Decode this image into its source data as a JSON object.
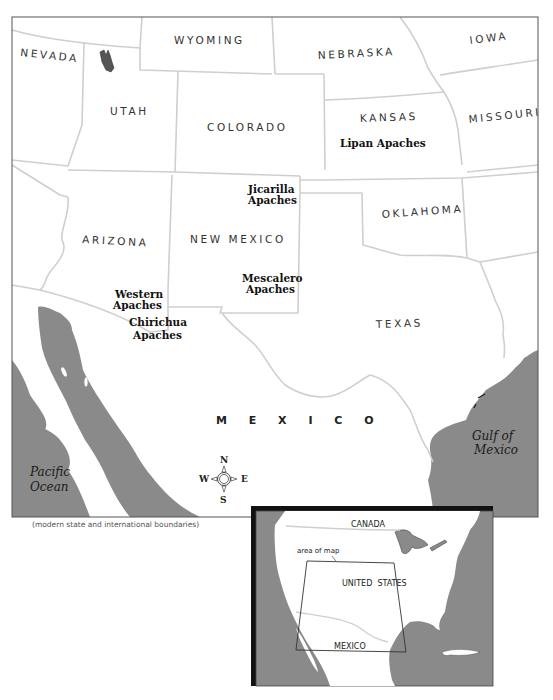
{
  "map": {
    "caption": "(modern state and international boundaries)",
    "states": [
      {
        "name": "NEVADA"
      },
      {
        "name": "UTAH"
      },
      {
        "name": "WYOMING"
      },
      {
        "name": "NEBRASKA"
      },
      {
        "name": "IOWA"
      },
      {
        "name": "COLORADO"
      },
      {
        "name": "KANSAS"
      },
      {
        "name": "MISSOURI"
      },
      {
        "name": "ARIZONA"
      },
      {
        "name": "NEW MEXICO"
      },
      {
        "name": "OKLAHOMA"
      },
      {
        "name": "TEXAS"
      }
    ],
    "tribes": [
      {
        "line1": "Lipan Apaches",
        "line2": ""
      },
      {
        "line1": "Jicarilla",
        "line2": "Apaches"
      },
      {
        "line1": "Mescalero",
        "line2": "Apaches"
      },
      {
        "line1": "Western",
        "line2": "Apaches"
      },
      {
        "line1": "Chirichua",
        "line2": "Apaches"
      }
    ],
    "country": "M E X I C O",
    "water": {
      "pacific_line1": "Pacific",
      "pacific_line2": "Ocean",
      "gulf_line1": "Gulf of",
      "gulf_line2": "Mexico"
    },
    "compass": {
      "n": "N",
      "s": "S",
      "e": "E",
      "w": "W"
    },
    "colors": {
      "water": "#8a8a8a",
      "land": "#ffffff",
      "border": "#cfcfcf",
      "frame": "#555555",
      "shadow": "#111111"
    }
  },
  "inset": {
    "canada": "CANADA",
    "area_of_map": "area of map",
    "united_states": "UNITED  STATES",
    "mexico": "MEXICO"
  }
}
